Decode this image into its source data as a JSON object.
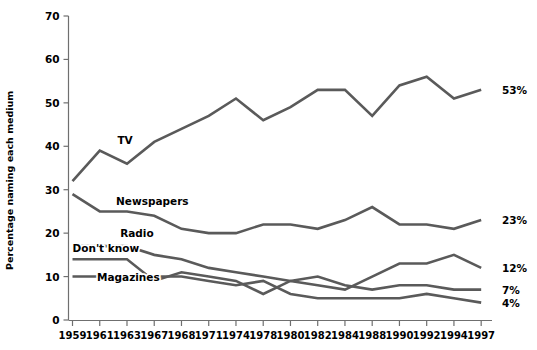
{
  "chart_data": {
    "type": "line",
    "title": "",
    "xlabel": "",
    "ylabel": "Percentage naming each medium",
    "categories": [
      "1959",
      "1961",
      "1963",
      "1967",
      "1968",
      "1971",
      "1974",
      "1978",
      "1980",
      "1982",
      "1984",
      "1988",
      "1990",
      "1992",
      "1994",
      "1997"
    ],
    "x": [
      1959,
      1961,
      1963,
      1967,
      1968,
      1971,
      1974,
      1978,
      1980,
      1982,
      1984,
      1988,
      1990,
      1992,
      1994,
      1997
    ],
    "ylim": [
      0,
      70
    ],
    "yticks": [
      0,
      10,
      20,
      30,
      40,
      50,
      60,
      70
    ],
    "grid": false,
    "legend": "inline-labels",
    "series": [
      {
        "name": "TV",
        "end_label": "53%",
        "values": [
          32,
          39,
          36,
          41,
          44,
          47,
          51,
          46,
          49,
          53,
          53,
          47,
          54,
          56,
          51,
          53
        ]
      },
      {
        "name": "Newspapers",
        "end_label": "23%",
        "values": [
          29,
          25,
          25,
          24,
          21,
          20,
          20,
          22,
          22,
          21,
          23,
          26,
          22,
          22,
          21,
          23
        ]
      },
      {
        "name": "Radio",
        "end_label": "12%",
        "values": [
          17,
          17,
          17,
          15,
          14,
          12,
          11,
          10,
          9,
          8,
          7,
          10,
          13,
          13,
          15,
          12
        ]
      },
      {
        "name": "Don't know",
        "end_label": "7%",
        "values": [
          14,
          14,
          14,
          9,
          11,
          10,
          9,
          6,
          9,
          10,
          8,
          7,
          8,
          8,
          7,
          7
        ]
      },
      {
        "name": "Magazines",
        "end_label": "4%",
        "values": [
          10,
          10,
          10,
          10,
          10,
          9,
          8,
          9,
          6,
          5,
          5,
          5,
          5,
          6,
          5,
          4
        ]
      }
    ],
    "annotations": [
      {
        "text": "TV",
        "x": 1962.3,
        "y": 40.5
      },
      {
        "text": "Newspapers",
        "x": 1962.2,
        "y": 26.5
      },
      {
        "text": "Radio",
        "x": 1962.5,
        "y": 19.2
      },
      {
        "text": "Don't know",
        "x": 1959.0,
        "y": 15.6
      },
      {
        "text": "Magazines",
        "x": 1960.8,
        "y": 9.0
      }
    ]
  },
  "axes": {
    "y_tick_labels": [
      "70",
      "60",
      "50",
      "40",
      "30",
      "20",
      "10",
      "0"
    ],
    "x_tick_labels": [
      "1959",
      "1961",
      "1963",
      "1967",
      "1968",
      "1971",
      "1974",
      "1978",
      "1980",
      "1982",
      "1984",
      "1988",
      "1990",
      "1992",
      "1994",
      "1997"
    ],
    "y_axis_title": "Percentage naming each medium"
  },
  "end_labels": [
    "53%",
    "23%",
    "12%",
    "7%",
    "4%"
  ],
  "colors": {
    "line": "#5a5a5a",
    "axis": "#6f6f6f",
    "text": "#000000",
    "background": "#ffffff"
  }
}
